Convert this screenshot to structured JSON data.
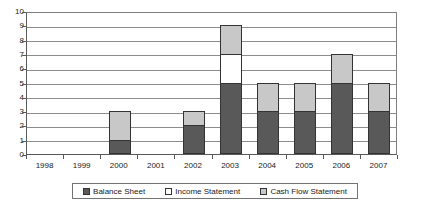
{
  "chart_data": {
    "type": "bar",
    "stacked": true,
    "title": "",
    "xlabel": "",
    "ylabel": "",
    "categories": [
      "1998",
      "1999",
      "2000",
      "2001",
      "2002",
      "2003",
      "2004",
      "2005",
      "2006",
      "2007"
    ],
    "ylim": [
      0,
      10
    ],
    "yticks": [
      0,
      1,
      2,
      3,
      4,
      5,
      6,
      7,
      8,
      9,
      10
    ],
    "ytick_labels": [
      "0",
      "1",
      "2",
      "3",
      "4",
      "5",
      "6",
      "7",
      "8",
      "9",
      "10"
    ],
    "grid": true,
    "legend_position": "bottom",
    "series": [
      {
        "name": "Balance Sheet",
        "color": "#595959",
        "values": [
          0,
          0,
          1,
          0,
          2,
          5,
          3,
          3,
          5,
          3
        ]
      },
      {
        "name": "Income Statement",
        "color": "#ffffff",
        "values": [
          0,
          0,
          0,
          0,
          0,
          2,
          0,
          0,
          0,
          0
        ]
      },
      {
        "name": "Cash Flow Statement",
        "color": "#c8c8c8",
        "values": [
          0,
          0,
          2,
          0,
          1,
          2,
          2,
          2,
          2,
          2
        ]
      }
    ],
    "totals": [
      0,
      0,
      3,
      0,
      3,
      9,
      5,
      5,
      7,
      5
    ]
  },
  "colors": {
    "balance_sheet": "#595959",
    "income_statement": "#ffffff",
    "cash_flow_statement": "#c8c8c8",
    "gridline": "#8c8c8c",
    "axis": "#595959",
    "bar_outline": "#333333",
    "text": "#1a1a1a",
    "background": "#ffffff"
  }
}
